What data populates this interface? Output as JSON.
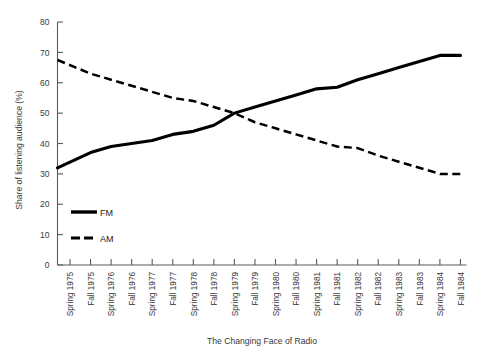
{
  "chart_data": {
    "type": "line",
    "title": "The Changing Face of Radio",
    "xlabel": "The Changing Face of Radio",
    "ylabel": "Share of listening audience (%)",
    "ylim": [
      0,
      80
    ],
    "yticks": [
      0,
      10,
      20,
      30,
      40,
      50,
      60,
      70,
      80
    ],
    "grid": false,
    "legend_position": "lower-left-inside",
    "categories": [
      "Spring 1975",
      "Fall 1975",
      "Spring 1976",
      "Fall 1976",
      "Spring 1977",
      "Fall 1977",
      "Spring 1978",
      "Fall 1978",
      "Spring 1979",
      "Fall 1979",
      "Spring 1980",
      "Fall 1980",
      "Spring 1981",
      "Fall 1981",
      "Spring 1982",
      "Fall 1982",
      "Spring 1983",
      "Fall 1983",
      "Spring 1984",
      "Fall 1984"
    ],
    "series": [
      {
        "name": "FM",
        "style": "solid",
        "color": "#000000",
        "values": [
          32,
          37,
          39,
          40,
          41,
          43,
          44,
          46,
          50,
          52,
          54,
          56,
          58,
          58.5,
          61,
          63,
          65,
          67,
          69,
          69
        ]
      },
      {
        "name": "AM",
        "style": "dashed",
        "color": "#000000",
        "values": [
          67.5,
          63,
          61,
          59,
          57,
          55,
          54,
          52,
          50,
          47,
          45,
          43,
          41,
          39,
          38.5,
          36,
          34,
          32,
          30,
          30
        ]
      }
    ]
  },
  "legend": {
    "entries": [
      {
        "label": "FM"
      },
      {
        "label": "AM"
      }
    ]
  }
}
